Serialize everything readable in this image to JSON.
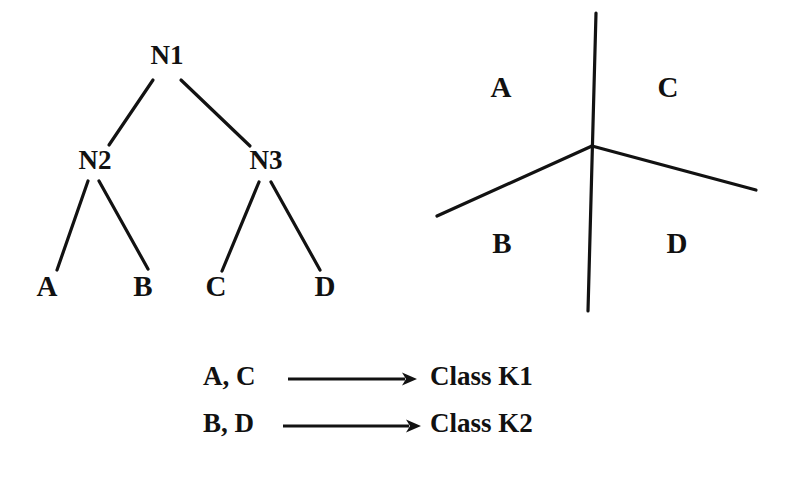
{
  "figure": {
    "background_color": "#ffffff",
    "ink_color": "#121212"
  },
  "tree": {
    "name": "decision-tree",
    "nodes": [
      {
        "id": "N1",
        "label": "N1",
        "x": 167,
        "y": 58,
        "role": "root"
      },
      {
        "id": "N2",
        "label": "N2",
        "x": 95,
        "y": 163,
        "role": "internal"
      },
      {
        "id": "N3",
        "label": "N3",
        "x": 266,
        "y": 163,
        "role": "internal"
      }
    ],
    "leaves": [
      {
        "id": "A",
        "label": "A",
        "x": 47,
        "y": 289
      },
      {
        "id": "B",
        "label": "B",
        "x": 143,
        "y": 289
      },
      {
        "id": "C",
        "label": "C",
        "x": 216,
        "y": 289
      },
      {
        "id": "D",
        "label": "D",
        "x": 325,
        "y": 289
      }
    ],
    "edges": [
      {
        "from": "N1",
        "to": "N2",
        "x1": 153,
        "y1": 80,
        "x2": 109,
        "y2": 145
      },
      {
        "from": "N1",
        "to": "N3",
        "x1": 181,
        "y1": 80,
        "x2": 250,
        "y2": 146
      },
      {
        "from": "N2",
        "to": "A",
        "x1": 88,
        "y1": 181,
        "x2": 57,
        "y2": 270
      },
      {
        "from": "N2",
        "to": "B",
        "x1": 99,
        "y1": 181,
        "x2": 148,
        "y2": 269
      },
      {
        "from": "N3",
        "to": "C",
        "x1": 259,
        "y1": 182,
        "x2": 222,
        "y2": 271
      },
      {
        "from": "N3",
        "to": "D",
        "x1": 271,
        "y1": 182,
        "x2": 320,
        "y2": 270
      }
    ]
  },
  "partition": {
    "name": "feature-space-partition",
    "junction": {
      "x": 592,
      "y": 146
    },
    "lines": [
      {
        "id": "vertical-split",
        "x1": 596,
        "y1": 13,
        "x2": 588,
        "y2": 311
      },
      {
        "id": "lower-left-split",
        "x1": 592,
        "y1": 146,
        "x2": 437,
        "y2": 216
      },
      {
        "id": "lower-right-split",
        "x1": 592,
        "y1": 146,
        "x2": 756,
        "y2": 190
      }
    ],
    "regions": [
      {
        "id": "A",
        "label": "A",
        "x": 501,
        "y": 90
      },
      {
        "id": "C",
        "label": "C",
        "x": 668,
        "y": 90
      },
      {
        "id": "B",
        "label": "B",
        "x": 502,
        "y": 246
      },
      {
        "id": "D",
        "label": "D",
        "x": 677,
        "y": 246
      }
    ]
  },
  "legend": {
    "name": "class-mapping-legend",
    "rows": [
      {
        "id": "row-k1",
        "source": "A, C",
        "target": "Class K1",
        "source_x": 203,
        "target_x": 430,
        "y": 379,
        "arrow_x1": 288,
        "arrow_x2": 417
      },
      {
        "id": "row-k2",
        "source": "B, D",
        "target": "Class K2",
        "source_x": 203,
        "target_x": 430,
        "y": 426,
        "arrow_x1": 283,
        "arrow_x2": 421
      }
    ]
  }
}
